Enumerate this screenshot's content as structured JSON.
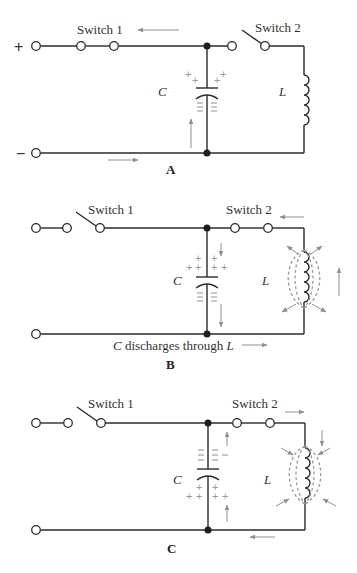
{
  "figure": {
    "panels": [
      {
        "id": "A",
        "caption": "A",
        "switch1_label": "Switch 1",
        "switch2_label": "Switch 2",
        "switch1_state": "closed",
        "switch2_state": "open",
        "capacitor_label": "C",
        "inductor_label": "L",
        "plus_terminal": "+",
        "minus_terminal": "−",
        "capacitor_top_charge": "+",
        "capacitor_bottom_charge": "−",
        "note": ""
      },
      {
        "id": "B",
        "caption": "B",
        "switch1_label": "Switch 1",
        "switch2_label": "Switch 2",
        "switch1_state": "open",
        "switch2_state": "closed",
        "capacitor_label": "C",
        "inductor_label": "L",
        "capacitor_top_charge": "+",
        "capacitor_bottom_charge": "−",
        "note_prefix": "C",
        "note_middle": " discharges through ",
        "note_suffix": "L"
      },
      {
        "id": "C",
        "caption": "C",
        "switch1_label": "Switch 1",
        "switch2_label": "Switch 2",
        "switch1_state": "open",
        "switch2_state": "closed",
        "capacitor_label": "C",
        "inductor_label": "L",
        "capacitor_top_charge": "−",
        "capacitor_bottom_charge": "+",
        "note": ""
      }
    ],
    "colors": {
      "wire": "#2a2a2a",
      "annotation": "#8f8f8f",
      "background": "#ffffff"
    }
  }
}
